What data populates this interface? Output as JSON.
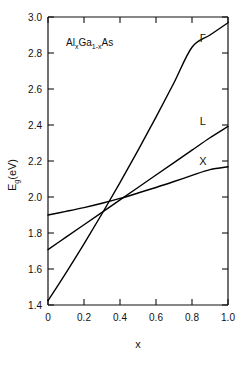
{
  "chart_data": {
    "type": "line",
    "title": "",
    "subtitle": "",
    "annotation": "AlxGa1-xAs",
    "annotation_parts": {
      "a1": "Al",
      "s1": "x",
      "a2": "Ga",
      "s2": "1-x",
      "a3": "As"
    },
    "xlabel": "x",
    "ylabel": "Eg(eV)",
    "ylabel_parts": {
      "base": "E",
      "sub": "g",
      "unit": "(eV)"
    },
    "xlim": [
      0,
      1.0
    ],
    "ylim": [
      1.4,
      3.0
    ],
    "xticks": [
      0,
      0.2,
      0.4,
      0.6,
      0.8,
      1.0
    ],
    "xticklabels": [
      "0",
      "0.2",
      "0.4",
      "0.6",
      "0.8",
      "1.0"
    ],
    "yticks": [
      1.4,
      1.6,
      1.8,
      2.0,
      2.2,
      2.4,
      2.6,
      2.8,
      3.0
    ],
    "yticklabels": [
      "1.4",
      "1.6",
      "1.8",
      "2.0",
      "2.2",
      "2.4",
      "2.6",
      "2.8",
      "3.0"
    ],
    "grid": false,
    "legend": "none",
    "legend_position": "inline-curve-end",
    "line_color": "#000000",
    "series": [
      {
        "name": "Γ",
        "label": "Γ",
        "label_x": 0.86,
        "label_y": 2.86,
        "x": [
          0.0,
          0.1,
          0.2,
          0.3,
          0.4,
          0.5,
          0.6,
          0.7,
          0.8,
          0.9,
          1.0
        ],
        "values": [
          1.424,
          1.579,
          1.74,
          1.907,
          2.08,
          2.259,
          2.444,
          2.635,
          2.832,
          2.9,
          2.968
        ]
      },
      {
        "name": "L",
        "label": "L",
        "label_x": 0.86,
        "label_y": 2.4,
        "x": [
          0.0,
          0.1,
          0.2,
          0.3,
          0.4,
          0.5,
          0.6,
          0.7,
          0.8,
          0.9,
          1.0
        ],
        "values": [
          1.708,
          1.777,
          1.846,
          1.915,
          1.984,
          2.053,
          2.122,
          2.191,
          2.26,
          2.329,
          2.392
        ]
      },
      {
        "name": "X",
        "label": "X",
        "label_x": 0.86,
        "label_y": 2.18,
        "x": [
          0.0,
          0.1,
          0.2,
          0.3,
          0.4,
          0.5,
          0.6,
          0.7,
          0.8,
          0.9,
          1.0
        ],
        "values": [
          1.9,
          1.92,
          1.941,
          1.965,
          1.992,
          2.022,
          2.053,
          2.086,
          2.12,
          2.152,
          2.168
        ]
      }
    ]
  }
}
